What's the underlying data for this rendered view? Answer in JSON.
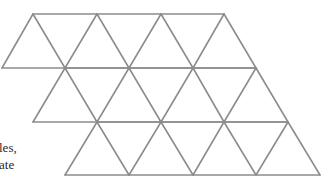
{
  "diagram": {
    "stroke_color": "#8c8c8c",
    "stroke_width": 1.6,
    "side_length": 64,
    "row_height": 54,
    "rows": [
      {
        "y_top": 14,
        "y_bottom": 68,
        "top_x": [
          33,
          97,
          161,
          224
        ],
        "bottom_x": [
          2,
          65,
          129,
          193,
          256
        ]
      },
      {
        "y_top": 68,
        "y_bottom": 122,
        "top_x": [
          65,
          129,
          193,
          256
        ],
        "bottom_x": [
          33,
          97,
          161,
          224,
          288
        ]
      },
      {
        "y_top": 122,
        "y_bottom": 175,
        "top_x": [
          97,
          161,
          224,
          288
        ],
        "bottom_x": [
          65,
          129,
          193,
          256,
          320
        ]
      }
    ],
    "triangle_count": 21
  },
  "caption": {
    "line1": "les,",
    "line2": "ate"
  }
}
